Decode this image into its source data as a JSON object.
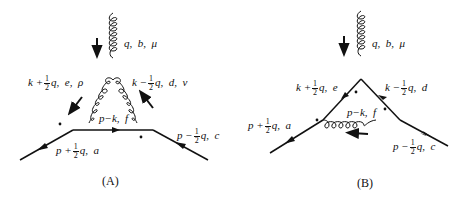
{
  "diagrams": [
    {
      "id": "A",
      "caption": "(A)",
      "external_gluon": {
        "momentum": "q,",
        "color": "b,",
        "index": "μ"
      },
      "left_gluon": {
        "momentum_prefix": "k +",
        "num": "1",
        "den": "2",
        "momentum_suffix": "q,",
        "color": "e,",
        "index": "ρ"
      },
      "right_gluon": {
        "momentum_prefix": "k −",
        "num": "1",
        "den": "2",
        "momentum_suffix": "q,",
        "color": "d,",
        "index": "ν"
      },
      "internal_line": {
        "label": "p−k,",
        "color": "f"
      },
      "outgoing_left": {
        "momentum_prefix": "p +",
        "num": "1",
        "den": "2",
        "momentum_suffix": "q,",
        "color": "a"
      },
      "incoming_right": {
        "momentum_prefix": "p −",
        "num": "1",
        "den": "2",
        "momentum_suffix": "q,",
        "color": "c"
      }
    },
    {
      "id": "B",
      "caption": "(B)",
      "external_gluon": {
        "momentum": "q,",
        "color": "b,",
        "index": "μ"
      },
      "left_line": {
        "momentum_prefix": "k +",
        "num": "1",
        "den": "2",
        "momentum_suffix": "q,",
        "color": "e"
      },
      "right_line": {
        "momentum_prefix": "k −",
        "num": "1",
        "den": "2",
        "momentum_suffix": "q,",
        "color": "d"
      },
      "internal_gluon": {
        "label": "p−k,",
        "color": "f"
      },
      "outgoing_left": {
        "momentum_prefix": "p +",
        "num": "1",
        "den": "2",
        "momentum_suffix": "q,",
        "color": "a"
      },
      "incoming_right": {
        "momentum_prefix": "p −",
        "num": "1",
        "den": "2",
        "momentum_suffix": "q,",
        "color": "c"
      }
    }
  ]
}
